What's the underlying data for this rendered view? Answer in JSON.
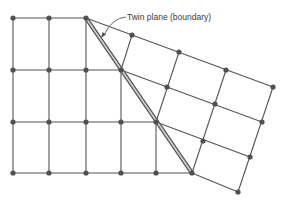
{
  "annotation": {
    "label": "Twin plane (boundary)"
  },
  "colors": {
    "line": "#555555",
    "node": "#505050",
    "boundary_fill": "#cfcfcf",
    "text": "#3a3a3a"
  },
  "lattice": {
    "left_nodes": [
      [
        13,
        18
      ],
      [
        49,
        18
      ],
      [
        86,
        18
      ],
      [
        13,
        70
      ],
      [
        49,
        70
      ],
      [
        86,
        70
      ],
      [
        121,
        70
      ],
      [
        13,
        122
      ],
      [
        49,
        122
      ],
      [
        86,
        122
      ],
      [
        121,
        122
      ],
      [
        156,
        122
      ],
      [
        13,
        173
      ],
      [
        49,
        173
      ],
      [
        86,
        173
      ],
      [
        121,
        173
      ],
      [
        156,
        173
      ],
      [
        192,
        173
      ]
    ],
    "boundary_nodes": [
      [
        86,
        18
      ],
      [
        121,
        70
      ],
      [
        156,
        122
      ],
      [
        192,
        173
      ]
    ],
    "twinned_nodes": [
      [
        132,
        35
      ],
      [
        179,
        52
      ],
      [
        226,
        70
      ],
      [
        273,
        87
      ],
      [
        167,
        87
      ],
      [
        215,
        104
      ],
      [
        262,
        122
      ],
      [
        203,
        141
      ],
      [
        250,
        157
      ],
      [
        238,
        192
      ]
    ]
  }
}
